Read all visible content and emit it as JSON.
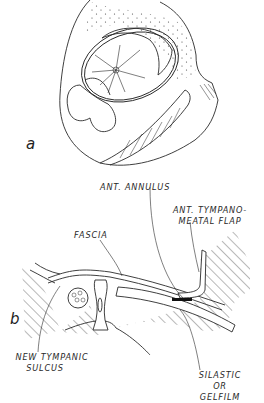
{
  "figure": {
    "panel_a": {
      "letter": "a"
    },
    "panel_b": {
      "letter": "b",
      "labels": {
        "ant_annulus": "ANT. ANNULUS",
        "ant_flap_line1": "ANT. TYMPANO-",
        "ant_flap_line2": "MEATAL FLAP",
        "fascia": "FASCIA",
        "new_sulcus_line1": "NEW TYMPANIC",
        "new_sulcus_line2": "SULCUS",
        "silastic_line1": "SILASTIC",
        "silastic_line2": "OR",
        "silastic_line3": "GELFILM"
      }
    },
    "colors": {
      "ink": "#2a2a2a",
      "background": "#ffffff"
    }
  }
}
